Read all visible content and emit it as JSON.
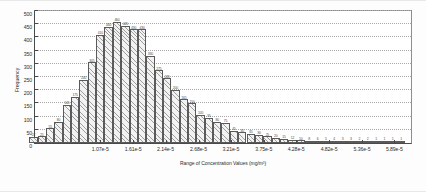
{
  "figure": {
    "background": "#ffffff",
    "bar_fill": "#f2f2f2",
    "bar_edge": "#5a5a5a",
    "axis_color": "#4a4a4a",
    "grid_color": "#a9a9a9",
    "note_left": "",
    "note_right": ""
  },
  "chart_data": {
    "type": "bar",
    "title": "",
    "xlabel": "Range of Concentration Values (mg/m³)",
    "ylabel": "Frequency",
    "ylim": [
      0,
      500
    ],
    "ytick_values": [
      0,
      50,
      100,
      150,
      200,
      250,
      300,
      350,
      400,
      450,
      500
    ],
    "ytick_labels": [
      "0",
      "50",
      "100",
      "150",
      "200",
      "250",
      "300",
      "350",
      "400",
      "450",
      "500"
    ],
    "grid": true,
    "grid_axis": "y",
    "legend": "none",
    "xlim": [
      0.0,
      6.1625e-05
    ],
    "bin_width": 1.3694e-06,
    "xtick_values": [
      1.07e-05,
      1.61e-05,
      2.14e-05,
      2.68e-05,
      3.21e-05,
      3.75e-05,
      4.28e-05,
      4.82e-05,
      5.36e-05,
      5.89e-05
    ],
    "xtick_labels": [
      "1.07e-5",
      "1.61e-5",
      "2.14e-5",
      "2.68e-5",
      "3.21e-5",
      "3.75e-5",
      "4.28e-5",
      "4.82e-5",
      "5.36e-5",
      "5.89e-5"
    ],
    "categories": [
      "b1",
      "b2",
      "b3",
      "b4",
      "b5",
      "b6",
      "b7",
      "b8",
      "b9",
      "b10",
      "b11",
      "b12",
      "b13",
      "b14",
      "b15",
      "b16",
      "b17",
      "b18",
      "b19",
      "b20",
      "b21",
      "b22",
      "b23",
      "b24",
      "b25",
      "b26",
      "b27",
      "b28",
      "b29",
      "b30",
      "b31",
      "b32",
      "b33",
      "b34",
      "b35",
      "b36",
      "b37",
      "b38",
      "b39",
      "b40",
      "b41",
      "b42",
      "b43",
      "b44",
      "b45"
    ],
    "values": [
      22,
      25,
      55,
      80,
      145,
      175,
      240,
      305,
      410,
      440,
      460,
      445,
      430,
      430,
      330,
      275,
      245,
      200,
      165,
      150,
      105,
      95,
      80,
      75,
      45,
      40,
      35,
      30,
      25,
      20,
      15,
      12,
      10,
      8,
      6,
      5,
      4,
      3,
      3,
      2,
      2,
      1,
      1,
      1,
      1
    ],
    "value_labels": [
      "22",
      "25",
      "55",
      "80",
      "145",
      "175",
      "240",
      "305",
      "410",
      "440",
      "460",
      "445",
      "430",
      "430",
      "330",
      "275",
      "245",
      "200",
      "165",
      "150",
      "105",
      "95",
      "80",
      "75",
      "45",
      "40",
      "35",
      "30",
      "25",
      "20",
      "15",
      "12",
      "10",
      "8",
      "6",
      "5",
      "4",
      "3",
      "3",
      "2",
      "2",
      "1",
      "1",
      "1",
      "1"
    ]
  }
}
